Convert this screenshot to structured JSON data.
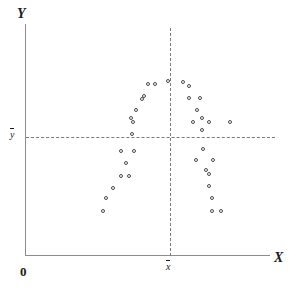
{
  "chart_data": {
    "type": "scatter",
    "title": "",
    "subtitle": "",
    "xlabel": "X",
    "ylabel": "Y",
    "origin_label": "0",
    "grid": false,
    "legend": null,
    "annotations": [
      {
        "name": "x-mean-line",
        "kind": "vertical-dashed",
        "label": "x̄",
        "x_px": 170
      },
      {
        "name": "y-mean-line",
        "kind": "horizontal-dashed",
        "label": "ȳ",
        "y_px": 137
      }
    ],
    "axis_ranges": {
      "x_px": [
        25,
        270
      ],
      "y_px": [
        24,
        255
      ]
    },
    "point_count": 36,
    "points_px": [
      {
        "x": 103,
        "y": 211
      },
      {
        "x": 106,
        "y": 198
      },
      {
        "x": 113,
        "y": 188
      },
      {
        "x": 121,
        "y": 176
      },
      {
        "x": 129,
        "y": 176
      },
      {
        "x": 126,
        "y": 163
      },
      {
        "x": 121,
        "y": 151
      },
      {
        "x": 134,
        "y": 151
      },
      {
        "x": 132,
        "y": 134
      },
      {
        "x": 133,
        "y": 122
      },
      {
        "x": 131,
        "y": 118
      },
      {
        "x": 136,
        "y": 110
      },
      {
        "x": 142,
        "y": 99
      },
      {
        "x": 144,
        "y": 96
      },
      {
        "x": 148,
        "y": 84
      },
      {
        "x": 155,
        "y": 84
      },
      {
        "x": 168,
        "y": 81
      },
      {
        "x": 183,
        "y": 82
      },
      {
        "x": 189,
        "y": 86
      },
      {
        "x": 189,
        "y": 98
      },
      {
        "x": 200,
        "y": 98
      },
      {
        "x": 197,
        "y": 110
      },
      {
        "x": 202,
        "y": 118
      },
      {
        "x": 193,
        "y": 122
      },
      {
        "x": 209,
        "y": 122
      },
      {
        "x": 202,
        "y": 130
      },
      {
        "x": 203,
        "y": 149
      },
      {
        "x": 196,
        "y": 160
      },
      {
        "x": 213,
        "y": 160
      },
      {
        "x": 206,
        "y": 170
      },
      {
        "x": 209,
        "y": 174
      },
      {
        "x": 209,
        "y": 186
      },
      {
        "x": 212,
        "y": 198
      },
      {
        "x": 212,
        "y": 211
      },
      {
        "x": 221,
        "y": 211
      },
      {
        "x": 230,
        "y": 122
      }
    ]
  },
  "labels": {
    "y_axis": "Y",
    "x_axis": "X",
    "origin": "0",
    "x_mean": "x",
    "y_mean": "y"
  },
  "colors": {
    "axis": "#8d8d8d",
    "dashed": "#7a7a7a",
    "point_stroke": "#4a4a4a",
    "point_fill": "#ffffff",
    "text": "#1a1a1a",
    "background": "#ffffff"
  }
}
